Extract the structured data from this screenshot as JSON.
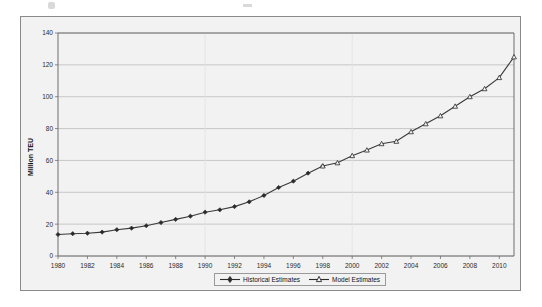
{
  "figure": {
    "y_axis_title": "Million TEU"
  },
  "legend": {
    "items": [
      {
        "label": "Historical Estimates",
        "marker": "filled-square-diamond",
        "color": "#2b2b2b"
      },
      {
        "label": "Model Estimates",
        "marker": "open-triangle",
        "color": "#2b2b2b"
      }
    ]
  },
  "chart_data": {
    "type": "line",
    "title": "",
    "subtitle": "",
    "xlabel": "",
    "ylabel": "Million TEU",
    "xlim": [
      1980,
      2011
    ],
    "ylim": [
      0,
      140
    ],
    "yticks": [
      0,
      20,
      40,
      60,
      80,
      100,
      120,
      140
    ],
    "xticks": [
      1980,
      1982,
      1984,
      1986,
      1988,
      1990,
      1992,
      1994,
      1996,
      1998,
      2000,
      2002,
      2004,
      2006,
      2008,
      2010
    ],
    "grid": "horizontal",
    "legend_position": "bottom-center",
    "x": [
      1980,
      1981,
      1982,
      1983,
      1984,
      1985,
      1986,
      1987,
      1988,
      1989,
      1990,
      1991,
      1992,
      1993,
      1994,
      1995,
      1996,
      1997,
      1998,
      1999,
      2000,
      2001,
      2002,
      2003,
      2004,
      2005,
      2006,
      2007,
      2008,
      2009,
      2010,
      2011
    ],
    "series": [
      {
        "name": "Historical Estimates",
        "marker": "filled",
        "color": "#2b2b2b",
        "values": [
          13.5,
          14.0,
          14.3,
          15.0,
          16.5,
          17.5,
          19.0,
          21.0,
          23.0,
          25.0,
          27.5,
          29.0,
          31.0,
          34.0,
          38.0,
          43.0,
          47.0,
          52.0,
          56.5,
          null,
          null,
          null,
          null,
          null,
          null,
          null,
          null,
          null,
          null,
          null,
          null,
          null
        ]
      },
      {
        "name": "Model Estimates",
        "marker": "open",
        "color": "#2b2b2b",
        "values": [
          null,
          null,
          null,
          null,
          null,
          null,
          null,
          null,
          null,
          null,
          null,
          null,
          null,
          null,
          null,
          null,
          null,
          null,
          56.5,
          58.5,
          63.0,
          66.5,
          70.5,
          72.0,
          78.0,
          83.0,
          88.0,
          94.0,
          100.0,
          105.0,
          112.0,
          125.0
        ]
      }
    ]
  }
}
